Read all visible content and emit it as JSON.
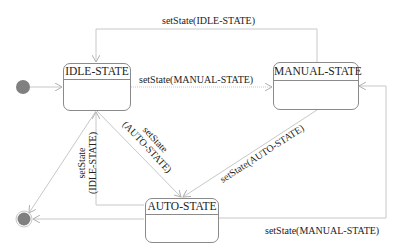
{
  "diagram": {
    "type": "uml-state-machine",
    "colors": {
      "line": "#c8c8c8",
      "border": "#8a8a8a",
      "pseudostate": "#808080",
      "text": "#222222"
    },
    "states": [
      {
        "id": "idle",
        "name": "IDLE-STATE"
      },
      {
        "id": "manual",
        "name": "MANUAL-STATE"
      },
      {
        "id": "auto",
        "name": "AUTO-STATE"
      }
    ],
    "pseudostates": {
      "initial": "initial-state",
      "final": "final-state"
    },
    "transitions": [
      {
        "from": "manual",
        "to": "idle",
        "label": "setState(IDLE-STATE)"
      },
      {
        "from": "idle",
        "to": "manual",
        "label": "setState(MANUAL-STATE)"
      },
      {
        "from": "idle",
        "to": "auto",
        "label_line1": "setState",
        "label_line2": "(AUTO-STATE)"
      },
      {
        "from": "manual",
        "to": "auto",
        "label": "setState(AUTO-STATE)"
      },
      {
        "from": "auto",
        "to": "idle",
        "label_line1": "setState",
        "label_line2": "(IDLE-STATE)"
      },
      {
        "from": "auto",
        "to": "manual",
        "label": "setState(MANUAL-STATE)"
      },
      {
        "from": "initial",
        "to": "idle",
        "label": ""
      },
      {
        "from": "idle",
        "to": "final",
        "label": ""
      },
      {
        "from": "auto",
        "to": "final",
        "label": ""
      }
    ]
  }
}
